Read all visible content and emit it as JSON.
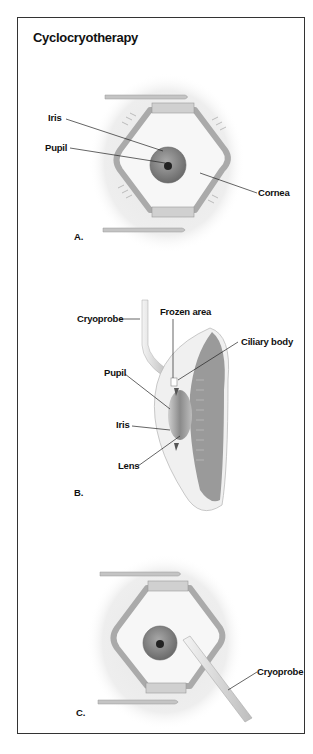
{
  "title": "Cyclocryotherapy",
  "panels": {
    "a": {
      "letter": "A.",
      "labels": {
        "iris": "Iris",
        "pupil": "Pupil",
        "cornea": "Cornea"
      }
    },
    "b": {
      "letter": "B.",
      "labels": {
        "cryoprobe": "Cryoprobe",
        "frozen_area": "Frozen area",
        "ciliary_body": "Ciliary body",
        "pupil": "Pupil",
        "iris": "Iris",
        "lens": "Lens"
      }
    },
    "c": {
      "letter": "C.",
      "labels": {
        "cryoprobe": "Cryoprobe"
      }
    }
  },
  "colors": {
    "border": "#333333",
    "skin_glow": "#ececec",
    "speculum": "#b8b8b8",
    "iris": "#8a8a8a",
    "pupil": "#222222",
    "tissue": "#9a9a9a"
  }
}
